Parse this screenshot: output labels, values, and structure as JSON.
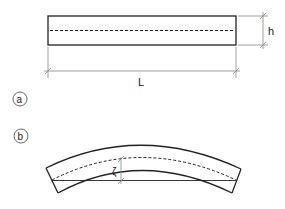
{
  "figure_a": {
    "label": "a",
    "dimension_length": "L",
    "dimension_height": "h"
  },
  "figure_b": {
    "label": "b",
    "deflection_symbol": "ζ"
  },
  "colors": {
    "stroke": "#222222",
    "dim_stroke": "#888888",
    "background": "#ffffff"
  }
}
